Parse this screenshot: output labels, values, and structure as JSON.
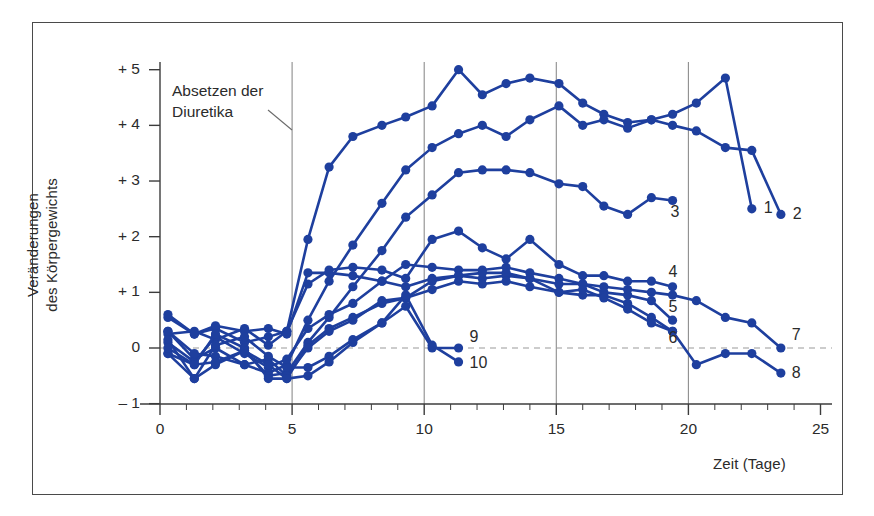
{
  "annotation": {
    "line1": "Absetzen der",
    "line2": "Diuretika"
  },
  "chart_data": {
    "type": "line",
    "title": "",
    "subtitle": "",
    "xlabel": "Zeit (Tage)",
    "ylabel": "Veränderungen des Körpergewichts",
    "ylabel_line1": "Veränderungen",
    "ylabel_line2": "des Körpergewichts",
    "xlim": [
      0,
      25.6
    ],
    "ylim": [
      -1,
      5.3
    ],
    "x_ticks": [
      0,
      5,
      10,
      15,
      20,
      25
    ],
    "x_tick_labels": [
      "0",
      "5",
      "10",
      "15",
      "20",
      "25"
    ],
    "x_minor_tick_step": 1,
    "y_ticks": [
      -1,
      0,
      1,
      2,
      3,
      4,
      5
    ],
    "y_tick_labels": [
      "– 1",
      "0",
      "+ 1",
      "+ 2",
      "+ 3",
      "+ 4",
      "+ 5"
    ],
    "grid": "vertical-only",
    "gridlines_x": [
      5,
      10,
      15,
      20
    ],
    "zero_line": {
      "value": 0,
      "style": "dashed",
      "color": "#9a9a9a"
    },
    "legend": "inline-end-labels",
    "line_color": "#1e3f9e",
    "marker": "filled-circle",
    "annotations": [
      {
        "text": "Absetzen der Diuretika",
        "points_to_x": 5
      }
    ],
    "series": [
      {
        "name": "1",
        "x": [
          0.3,
          1.3,
          2.1,
          3.2,
          4.1,
          4.8,
          5.6,
          6.4,
          7.3,
          8.4,
          9.3,
          10.3,
          11.3,
          12.2,
          13.1,
          14.0,
          15.1,
          16.0,
          16.8,
          17.7,
          18.6,
          19.4,
          20.3,
          21.4,
          22.4
        ],
        "y": [
          0.55,
          0.25,
          0.35,
          0.1,
          0.2,
          0.3,
          1.95,
          3.25,
          3.8,
          4.0,
          4.15,
          4.35,
          5.0,
          4.55,
          4.75,
          4.85,
          4.75,
          4.4,
          4.2,
          4.05,
          4.1,
          4.2,
          4.4,
          4.85,
          2.5
        ]
      },
      {
        "name": "2",
        "x": [
          0.3,
          1.3,
          2.1,
          3.2,
          4.1,
          4.8,
          5.6,
          6.4,
          7.3,
          8.4,
          9.3,
          10.3,
          11.3,
          12.2,
          13.1,
          14.0,
          15.1,
          16.0,
          16.8,
          17.7,
          18.6,
          19.4,
          20.3,
          21.4,
          22.4,
          23.5
        ],
        "y": [
          0.3,
          -0.2,
          0.0,
          -0.3,
          -0.45,
          -0.3,
          0.5,
          1.2,
          1.85,
          2.6,
          3.2,
          3.6,
          3.85,
          4.0,
          3.8,
          4.1,
          4.35,
          4.0,
          4.1,
          3.95,
          4.1,
          4.0,
          3.9,
          3.6,
          3.55,
          2.4
        ]
      },
      {
        "name": "3",
        "x": [
          0.3,
          1.3,
          2.1,
          3.2,
          4.1,
          4.8,
          5.6,
          6.4,
          7.3,
          8.4,
          9.3,
          10.3,
          11.3,
          12.2,
          13.1,
          14.0,
          15.1,
          16.0,
          16.8,
          17.7,
          18.6,
          19.4
        ],
        "y": [
          -0.1,
          -0.55,
          -0.3,
          -0.05,
          -0.5,
          -0.45,
          0.1,
          0.55,
          1.1,
          1.75,
          2.35,
          2.75,
          3.15,
          3.2,
          3.2,
          3.15,
          2.95,
          2.9,
          2.55,
          2.4,
          2.7,
          2.65
        ]
      },
      {
        "name": "4",
        "x": [
          0.3,
          1.3,
          2.1,
          3.2,
          4.1,
          4.8,
          5.6,
          6.4,
          7.3,
          8.4,
          9.3,
          10.3,
          11.3,
          12.2,
          13.1,
          14.0,
          15.1,
          16.0,
          16.8,
          17.7,
          18.6,
          19.4
        ],
        "y": [
          0.25,
          0.3,
          0.15,
          0.35,
          0.05,
          0.3,
          1.15,
          1.4,
          1.45,
          1.4,
          1.25,
          1.95,
          2.1,
          1.8,
          1.6,
          1.95,
          1.5,
          1.3,
          1.3,
          1.2,
          1.2,
          1.1
        ]
      },
      {
        "name": "5",
        "x": [
          0.3,
          1.3,
          2.1,
          3.2,
          4.1,
          4.8,
          5.6,
          6.4,
          7.3,
          8.4,
          9.3,
          10.3,
          11.3,
          12.2,
          13.1,
          14.0,
          15.1,
          16.0,
          16.8,
          17.7,
          18.6,
          19.4
        ],
        "y": [
          0.1,
          -0.25,
          0.2,
          -0.1,
          -0.35,
          -0.2,
          0.35,
          0.6,
          0.8,
          1.2,
          1.5,
          1.45,
          1.4,
          1.4,
          1.45,
          1.35,
          1.25,
          1.15,
          1.0,
          0.95,
          0.85,
          0.5
        ]
      },
      {
        "name": "6",
        "x": [
          0.3,
          1.3,
          2.1,
          3.2,
          4.1,
          4.8,
          5.6,
          6.4,
          7.3,
          8.4,
          9.3,
          10.3,
          11.3,
          12.2,
          13.1,
          14.0,
          15.1,
          16.0,
          16.8,
          17.7,
          18.6,
          19.4
        ],
        "y": [
          0.6,
          0.25,
          0.4,
          0.3,
          0.35,
          0.25,
          1.35,
          1.35,
          1.3,
          1.2,
          1.1,
          1.25,
          1.3,
          1.25,
          1.3,
          1.25,
          1.0,
          0.95,
          0.95,
          0.8,
          0.55,
          0.3
        ]
      },
      {
        "name": "7",
        "x": [
          0.3,
          1.3,
          2.1,
          3.2,
          4.1,
          4.8,
          5.6,
          6.4,
          7.3,
          8.4,
          9.3,
          10.3,
          11.3,
          12.2,
          13.1,
          14.0,
          15.1,
          16.0,
          16.8,
          17.7,
          18.6,
          19.4,
          20.3,
          21.4,
          22.4,
          23.5
        ],
        "y": [
          -0.1,
          -0.3,
          0.25,
          0.0,
          -0.55,
          -0.55,
          0.05,
          0.35,
          0.55,
          0.8,
          0.9,
          1.2,
          1.3,
          1.35,
          1.35,
          1.25,
          1.15,
          1.15,
          1.1,
          1.05,
          1.0,
          0.95,
          0.85,
          0.55,
          0.45,
          0.0
        ]
      },
      {
        "name": "8",
        "x": [
          0.3,
          1.3,
          2.1,
          3.2,
          4.1,
          4.8,
          5.6,
          6.4,
          7.3,
          8.4,
          9.3,
          10.3,
          11.3,
          12.2,
          13.1,
          14.0,
          15.1,
          16.0,
          16.8,
          17.7,
          18.6,
          19.4,
          20.3,
          21.4,
          22.4,
          23.5
        ],
        "y": [
          0.3,
          -0.1,
          -0.15,
          -0.3,
          -0.2,
          -0.5,
          0.0,
          0.3,
          0.5,
          0.85,
          0.9,
          1.05,
          1.2,
          1.15,
          1.2,
          1.1,
          1.0,
          1.05,
          0.9,
          0.7,
          0.45,
          0.3,
          -0.3,
          -0.1,
          -0.1,
          -0.45
        ]
      },
      {
        "name": "9",
        "x": [
          0.3,
          1.3,
          2.1,
          3.2,
          4.1,
          4.8,
          5.6,
          6.4,
          7.3,
          8.4,
          9.3,
          10.3,
          11.3
        ],
        "y": [
          0.15,
          -0.55,
          0.05,
          0.2,
          -0.15,
          -0.35,
          -0.35,
          -0.15,
          0.15,
          0.45,
          0.75,
          0.0,
          0.0
        ]
      },
      {
        "name": "10",
        "x": [
          0.3,
          1.3,
          2.1,
          3.2,
          4.1,
          4.8,
          5.6,
          6.4,
          7.3,
          8.4,
          9.3,
          10.3,
          11.3
        ],
        "y": [
          0.0,
          -0.3,
          -0.25,
          -0.05,
          -0.3,
          -0.55,
          -0.5,
          -0.25,
          0.1,
          0.45,
          0.95,
          0.05,
          -0.25
        ]
      }
    ],
    "series_end_labels": [
      "1",
      "2",
      "3",
      "4",
      "5",
      "6",
      "7",
      "8",
      "9",
      "10"
    ]
  }
}
